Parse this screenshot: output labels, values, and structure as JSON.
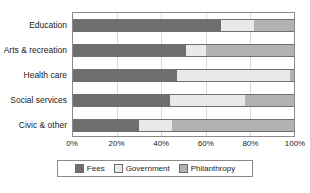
{
  "chart_data": {
    "type": "bar",
    "orientation": "horizontal",
    "stacked": true,
    "normalized_percent": true,
    "title": "",
    "subtitle": "",
    "xlabel": "",
    "ylabel": "",
    "xlim": [
      0,
      100
    ],
    "xticks": [
      0,
      20,
      40,
      60,
      80,
      100
    ],
    "xtick_labels": [
      "0%",
      "20%",
      "40%",
      "60%",
      "80%",
      "100%"
    ],
    "grid": true,
    "grid_axis": "x",
    "legend_position": "bottom",
    "categories": [
      "Education",
      "Arts & recreation",
      "Health care",
      "Social services",
      "Civic & other"
    ],
    "series": [
      {
        "name": "Fees",
        "color": "#6e6e6e",
        "values": [
          67,
          51,
          47,
          44,
          30
        ]
      },
      {
        "name": "Government",
        "color": "#e9e9e9",
        "values": [
          15,
          9,
          51,
          34,
          15
        ]
      },
      {
        "name": "Philanthropy",
        "color": "#b2b2b2",
        "values": [
          18,
          40,
          2,
          22,
          55
        ]
      }
    ]
  },
  "legend": {
    "items": [
      {
        "label": "Fees",
        "key": "fees"
      },
      {
        "label": "Government",
        "key": "government"
      },
      {
        "label": "Philanthropy",
        "key": "philanthropy"
      }
    ]
  }
}
